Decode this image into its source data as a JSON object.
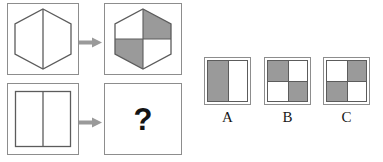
{
  "colors": {
    "shade": "#9a9a9a",
    "blank": "#ffffff",
    "stroke": "#5c5c5c",
    "panel_border": "#8d8d8d",
    "arrow": "#9a9a9a",
    "text": "#181818"
  },
  "matrix": {
    "name": "analogy-matrix",
    "rows": [
      {
        "id": "row-1",
        "source": {
          "shape": "hexagon",
          "divider": "vertical-line",
          "fill": "blank",
          "label": "hexagon outline with vertical midline"
        },
        "relation": {
          "icon": "right-arrow-icon",
          "label": "transforms into"
        },
        "result": {
          "shape": "hexagon",
          "pattern": "checkerboard",
          "quadrants": [
            "blank",
            "shade",
            "shade",
            "blank"
          ],
          "label": "hexagon with checkerboard quadrants"
        }
      },
      {
        "id": "row-2",
        "source": {
          "shape": "square",
          "divider": "vertical-line",
          "fill": "blank",
          "label": "square outline with vertical midline"
        },
        "relation": {
          "icon": "right-arrow-icon",
          "label": "transforms into"
        },
        "result": {
          "shape": "unknown",
          "glyph": "?",
          "label": "missing answer"
        }
      }
    ]
  },
  "options": {
    "name": "answer-options",
    "items": [
      {
        "label": "A",
        "layout": "halves",
        "cells": [
          "shade",
          "blank"
        ],
        "description": "square split vertically, left shaded"
      },
      {
        "label": "B",
        "layout": "quarters",
        "cells": [
          "shade",
          "blank",
          "blank",
          "shade"
        ],
        "description": "checkerboard, top-left shaded"
      },
      {
        "label": "C",
        "layout": "quarters",
        "cells": [
          "blank",
          "shade",
          "shade",
          "blank"
        ],
        "description": "checkerboard, top-right shaded"
      }
    ]
  }
}
